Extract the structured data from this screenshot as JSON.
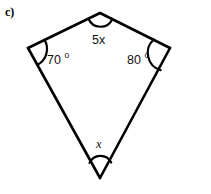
{
  "figure": {
    "part_label": "c)",
    "shape": "quadrilateral",
    "vertices": {
      "top": {
        "x": 100,
        "y": 13
      },
      "left": {
        "x": 28,
        "y": 48
      },
      "right": {
        "x": 170,
        "y": 48
      },
      "bottom": {
        "x": 100,
        "y": 178
      }
    },
    "edges": [
      {
        "name": "top-left-edge",
        "from": "left",
        "to": "top"
      },
      {
        "name": "top-right-edge",
        "from": "top",
        "to": "right"
      },
      {
        "name": "bottom-right-edge",
        "from": "right",
        "to": "bottom"
      },
      {
        "name": "bottom-left-edge",
        "from": "bottom",
        "to": "left"
      }
    ],
    "angles": [
      {
        "name": "top-angle",
        "vertex": "top",
        "label": "5x",
        "label_kind": "expression",
        "label_x": 92,
        "label_y": 44
      },
      {
        "name": "left-angle",
        "vertex": "left",
        "label": "70",
        "degree_symbol": "o",
        "label_kind": "measure",
        "label_x": 47,
        "label_y": 64
      },
      {
        "name": "right-angle",
        "vertex": "right",
        "label": "80",
        "degree_symbol": "o",
        "label_kind": "measure",
        "label_x": 127,
        "label_y": 64
      },
      {
        "name": "bottom-angle",
        "vertex": "bottom",
        "label": "x",
        "label_kind": "variable",
        "label_x": 96,
        "label_y": 148
      }
    ],
    "colors": {
      "stroke": "#000000",
      "text": "#111111",
      "background": "#ffffff"
    }
  }
}
